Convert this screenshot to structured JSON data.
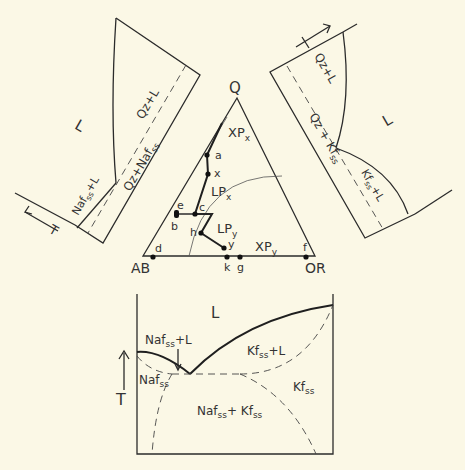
{
  "diagram": {
    "colors": {
      "background": "#fbf8e6",
      "line": "#2b2b2b"
    },
    "triangle": {
      "vertices": {
        "top": "Q",
        "left": "AB",
        "right": "OR"
      },
      "fields": {
        "xpx": "XP",
        "xpx_sub": "x",
        "lpx": "LP",
        "lpx_sub": "x",
        "lpy": "LP",
        "lpy_sub": "y",
        "xpy": "XP",
        "xpy_sub": "y"
      },
      "points": {
        "a": "a",
        "x": "x",
        "e": "e",
        "b": "b",
        "c": "c",
        "h": "h",
        "y": "y",
        "d": "d",
        "k": "k",
        "g": "g",
        "f": "f"
      }
    },
    "left_panel": {
      "liquid": "L",
      "qz_l": "Qz+L",
      "qz_naf": "Qz+Naf",
      "qz_naf_sub": "ss",
      "naf_l": "Naf",
      "naf_l_sub": "ss",
      "naf_l_suffix": "+L",
      "axis": "T"
    },
    "right_panel": {
      "liquid": "L",
      "qz_l": "Qz+L",
      "qz_kf": "Qz + Kf",
      "qz_kf_sub": "ss",
      "kf_l": "Kf",
      "kf_l_sub": "ss",
      "kf_l_suffix": "+L",
      "axis": "T"
    },
    "bottom_panel": {
      "liquid": "L",
      "naf_l": "Naf",
      "naf_l_sub": "ss",
      "naf_l_suffix": "+L",
      "kf_l": "Kf",
      "kf_l_sub": "ss",
      "kf_l_suffix": "+L",
      "naf": "Naf",
      "naf_sub": "ss",
      "kf": "Kf",
      "kf_sub": "ss",
      "naf_kf_a": "Naf",
      "naf_kf_a_sub": "ss",
      "naf_kf_plus": "+ Kf",
      "naf_kf_b_sub": "ss",
      "axis": "T"
    }
  }
}
